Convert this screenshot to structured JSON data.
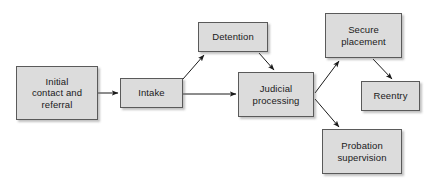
{
  "diagram": {
    "canvas": {
      "width": 438,
      "height": 183
    },
    "style": {
      "node_fill": "#dcdcdc",
      "node_border": "#5a5a5a",
      "edge_color": "#1a1a1a",
      "background": "#ffffff",
      "text_color": "#1a1a1a"
    },
    "nodes": [
      {
        "id": "initial-contact",
        "label": "Initial\ncontact and\nreferral",
        "x": 16,
        "y": 66,
        "w": 82,
        "h": 54
      },
      {
        "id": "intake",
        "label": "Intake",
        "x": 120,
        "y": 78,
        "w": 63,
        "h": 30
      },
      {
        "id": "detention",
        "label": "Detention",
        "x": 198,
        "y": 22,
        "w": 70,
        "h": 30
      },
      {
        "id": "judicial-processing",
        "label": "Judicial\nprocessing",
        "x": 238,
        "y": 72,
        "w": 76,
        "h": 45
      },
      {
        "id": "secure-placement",
        "label": "Secure\nplacement",
        "x": 325,
        "y": 13,
        "w": 77,
        "h": 45
      },
      {
        "id": "reentry",
        "label": "Reentry",
        "x": 361,
        "y": 81,
        "w": 59,
        "h": 30
      },
      {
        "id": "probation-supervision",
        "label": "Probation\nsupervision",
        "x": 322,
        "y": 129,
        "w": 80,
        "h": 45
      }
    ],
    "edges": [
      {
        "id": "initial-to-intake",
        "from": "initial-contact",
        "to": "intake",
        "x1": 98,
        "y1": 93,
        "x2": 118,
        "y2": 93
      },
      {
        "id": "intake-to-detention",
        "from": "intake",
        "to": "detention",
        "x1": 183,
        "y1": 79,
        "x2": 204,
        "y2": 55
      },
      {
        "id": "intake-to-judicial",
        "from": "intake",
        "to": "judicial-processing",
        "x1": 183,
        "y1": 94,
        "x2": 236,
        "y2": 94
      },
      {
        "id": "detention-to-judicial",
        "from": "detention",
        "to": "judicial-processing",
        "x1": 259,
        "y1": 53,
        "x2": 274,
        "y2": 70
      },
      {
        "id": "judicial-to-secure-placement",
        "from": "judicial-processing",
        "to": "secure-placement",
        "x1": 315,
        "y1": 93,
        "x2": 339,
        "y2": 61
      },
      {
        "id": "judicial-to-probation",
        "from": "judicial-processing",
        "to": "probation-supervision",
        "x1": 315,
        "y1": 99,
        "x2": 339,
        "y2": 127
      },
      {
        "id": "secure-placement-to-reentry",
        "from": "secure-placement",
        "to": "reentry",
        "x1": 373,
        "y1": 59,
        "x2": 392,
        "y2": 79
      }
    ]
  }
}
